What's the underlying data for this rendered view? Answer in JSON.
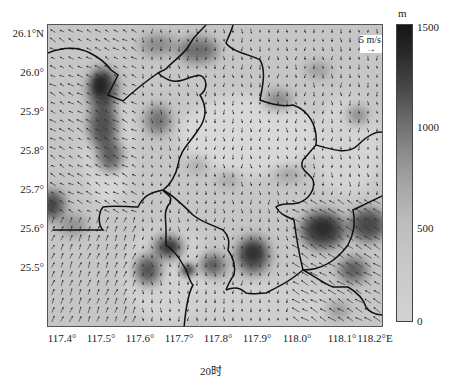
{
  "chart_data": {
    "type": "map",
    "title": "",
    "subtitle": "20时",
    "xlabel": "longitude",
    "ylabel": "latitude",
    "x_ticks": [
      "117.4°",
      "117.5°",
      "117.6°",
      "117.7°",
      "117.8°",
      "117.9°",
      "118.0°",
      "118.1°",
      "118.2°E"
    ],
    "y_ticks": [
      "26.1°N",
      "26.0°",
      "25.9°",
      "25.8°",
      "25.7°",
      "25.6°",
      "25.5°"
    ],
    "xlim": [
      117.36,
      118.21
    ],
    "ylim": [
      25.42,
      26.19
    ],
    "colorbar": {
      "unit": "m",
      "ticks": [
        "1500",
        "1000",
        "500",
        "0"
      ],
      "range": [
        0,
        1500
      ],
      "colormap": "grayscale (dark = high)"
    },
    "wind_reference": {
      "label": "5 m/s",
      "value": 5
    },
    "grid": false
  },
  "axes": {
    "y_labels": [
      {
        "text": "26.1°N",
        "y": 34
      },
      {
        "text": "26.0°",
        "y": 73
      },
      {
        "text": "25.9°",
        "y": 112
      },
      {
        "text": "25.8°",
        "y": 151
      },
      {
        "text": "25.7°",
        "y": 190
      },
      {
        "text": "25.6°",
        "y": 229
      },
      {
        "text": "25.5°",
        "y": 268
      }
    ],
    "x_labels": [
      {
        "text": "117.4°",
        "x": 62
      },
      {
        "text": "117.5°",
        "x": 101
      },
      {
        "text": "117.6°",
        "x": 140
      },
      {
        "text": "117.7°",
        "x": 179
      },
      {
        "text": "117.8°",
        "x": 218
      },
      {
        "text": "117.9°",
        "x": 257
      },
      {
        "text": "118.0°",
        "x": 297
      },
      {
        "text": "118.1°",
        "x": 342
      },
      {
        "text": "118.2°E",
        "x": 375
      }
    ]
  },
  "colorbar": {
    "unit": "m",
    "ticks": [
      {
        "text": "1500",
        "y": 24
      },
      {
        "text": "1000",
        "y": 125
      },
      {
        "text": "500",
        "y": 228
      },
      {
        "text": "0",
        "y": 322
      }
    ]
  },
  "legend": {
    "wind_label": "5 m/s",
    "arrow": "→"
  },
  "caption": "20时"
}
